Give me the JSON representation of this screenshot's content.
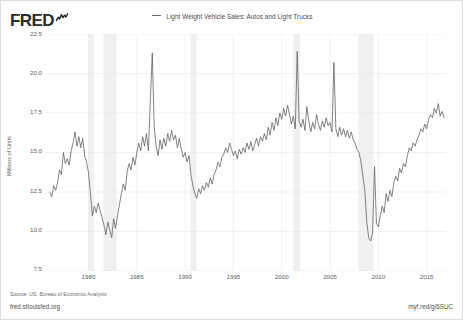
{
  "branding": {
    "logo_text": "FRED",
    "logo_icon": "squiggle-chart-icon"
  },
  "legend": {
    "entries": [
      {
        "label": "Light Weight Vehicle Sales: Autos and Light Trucks",
        "color": "#6e6e6e",
        "marker": "line-dash-icon"
      }
    ]
  },
  "footer": {
    "source": "Source: US. Bureau of Economic Analysis",
    "fred_url": "fred.stlouisfed.org",
    "short_url": "myf.red/g/6SUC"
  },
  "chart_data": {
    "type": "line",
    "title": "",
    "subtitle": "",
    "xlabel": "",
    "ylabel": "Millions of Units",
    "xlim": [
      1975.6,
      2017.0
    ],
    "ylim": [
      7.5,
      22.5
    ],
    "yticks": [
      22.5,
      20.0,
      17.5,
      15.0,
      12.5,
      10.0,
      7.5
    ],
    "ytick_labels": [
      "22.5",
      "20.0",
      "17.5",
      "15.0",
      "12.5",
      "10.0",
      "7.5"
    ],
    "xticks": [
      1980,
      1985,
      1990,
      1995,
      2000,
      2005,
      2010,
      2015
    ],
    "xtick_labels": [
      "1980",
      "1985",
      "1990",
      "1995",
      "2000",
      "2005",
      "2010",
      "2015"
    ],
    "grid": true,
    "grid_color": "#e8e8e8",
    "line_color": "#5a5a5a",
    "legend_position": "top-center",
    "recession_bands": [
      {
        "start": 1980.0,
        "end": 1980.55,
        "label": "1980 recession"
      },
      {
        "start": 1981.55,
        "end": 1982.9,
        "label": "1981-82 recession"
      },
      {
        "start": 1990.55,
        "end": 1991.2,
        "label": "1990-91 recession"
      },
      {
        "start": 2001.2,
        "end": 2001.9,
        "label": "2001 recession"
      },
      {
        "start": 2007.95,
        "end": 2009.5,
        "label": "2007-09 recession"
      }
    ],
    "recession_band_color": "#f0f0f0",
    "series": [
      {
        "name": "Light Weight Vehicle Sales: Autos and Light Trucks",
        "units": "Millions of Units",
        "x": [
          1976.0,
          1976.2,
          1976.4,
          1976.6,
          1976.8,
          1977.0,
          1977.2,
          1977.4,
          1977.6,
          1977.8,
          1978.0,
          1978.2,
          1978.4,
          1978.6,
          1978.8,
          1979.0,
          1979.2,
          1979.4,
          1979.6,
          1979.8,
          1980.0,
          1980.2,
          1980.4,
          1980.6,
          1980.8,
          1981.0,
          1981.2,
          1981.4,
          1981.6,
          1981.8,
          1982.0,
          1982.2,
          1982.4,
          1982.6,
          1982.8,
          1983.0,
          1983.2,
          1983.4,
          1983.6,
          1983.8,
          1984.0,
          1984.2,
          1984.4,
          1984.6,
          1984.8,
          1985.0,
          1985.2,
          1985.4,
          1985.6,
          1985.8,
          1986.0,
          1986.2,
          1986.4,
          1986.6,
          1986.8,
          1987.0,
          1987.2,
          1987.4,
          1987.6,
          1987.8,
          1988.0,
          1988.2,
          1988.4,
          1988.6,
          1988.8,
          1989.0,
          1989.2,
          1989.4,
          1989.6,
          1989.8,
          1990.0,
          1990.2,
          1990.4,
          1990.6,
          1990.8,
          1991.0,
          1991.2,
          1991.4,
          1991.6,
          1991.8,
          1992.0,
          1992.2,
          1992.4,
          1992.6,
          1992.8,
          1993.0,
          1993.2,
          1993.4,
          1993.6,
          1993.8,
          1994.0,
          1994.2,
          1994.4,
          1994.6,
          1994.8,
          1995.0,
          1995.2,
          1995.4,
          1995.6,
          1995.8,
          1996.0,
          1996.2,
          1996.4,
          1996.6,
          1996.8,
          1997.0,
          1997.2,
          1997.4,
          1997.6,
          1997.8,
          1998.0,
          1998.2,
          1998.4,
          1998.6,
          1998.8,
          1999.0,
          1999.2,
          1999.4,
          1999.6,
          1999.8,
          2000.0,
          2000.2,
          2000.4,
          2000.6,
          2000.8,
          2001.0,
          2001.2,
          2001.4,
          2001.6,
          2001.8,
          2002.0,
          2002.2,
          2002.4,
          2002.6,
          2002.8,
          2003.0,
          2003.2,
          2003.4,
          2003.6,
          2003.8,
          2004.0,
          2004.2,
          2004.4,
          2004.6,
          2004.8,
          2005.0,
          2005.2,
          2005.4,
          2005.6,
          2005.8,
          2006.0,
          2006.2,
          2006.4,
          2006.6,
          2006.8,
          2007.0,
          2007.2,
          2007.4,
          2007.6,
          2007.8,
          2008.0,
          2008.2,
          2008.4,
          2008.6,
          2008.8,
          2009.0,
          2009.2,
          2009.4,
          2009.6,
          2009.8,
          2010.0,
          2010.2,
          2010.4,
          2010.6,
          2010.8,
          2011.0,
          2011.2,
          2011.4,
          2011.6,
          2011.8,
          2012.0,
          2012.2,
          2012.4,
          2012.6,
          2012.8,
          2013.0,
          2013.2,
          2013.4,
          2013.6,
          2013.8,
          2014.0,
          2014.2,
          2014.4,
          2014.6,
          2014.8,
          2015.0,
          2015.2,
          2015.4,
          2015.6,
          2015.8,
          2016.0,
          2016.2,
          2016.4,
          2016.6,
          2016.8
        ],
        "y": [
          12.5,
          12.2,
          12.9,
          12.6,
          13.1,
          13.9,
          13.6,
          15.0,
          14.3,
          14.6,
          14.2,
          15.1,
          15.6,
          16.3,
          15.4,
          16.0,
          15.3,
          15.9,
          14.8,
          14.4,
          13.7,
          12.4,
          11.0,
          11.6,
          11.2,
          11.8,
          11.3,
          10.9,
          10.4,
          9.8,
          10.6,
          10.1,
          9.6,
          10.8,
          10.2,
          11.0,
          11.7,
          12.4,
          13.0,
          12.6,
          13.8,
          14.3,
          13.9,
          14.7,
          14.2,
          15.0,
          15.6,
          15.1,
          16.0,
          15.4,
          16.2,
          15.1,
          18.3,
          21.3,
          16.6,
          15.4,
          14.8,
          15.8,
          15.2,
          15.9,
          15.4,
          16.2,
          15.7,
          16.4,
          15.8,
          16.1,
          15.3,
          15.9,
          15.2,
          14.7,
          15.0,
          14.4,
          14.8,
          13.6,
          12.9,
          12.4,
          12.1,
          12.7,
          12.4,
          12.9,
          12.6,
          13.1,
          12.8,
          13.4,
          13.0,
          13.6,
          13.9,
          14.4,
          14.1,
          14.7,
          14.9,
          15.3,
          15.0,
          15.6,
          15.2,
          14.8,
          15.1,
          14.6,
          15.2,
          14.9,
          15.3,
          15.0,
          15.6,
          15.2,
          15.7,
          15.1,
          15.5,
          15.9,
          15.4,
          16.0,
          15.7,
          16.2,
          15.8,
          16.6,
          16.1,
          16.9,
          16.4,
          17.2,
          16.7,
          17.5,
          17.1,
          17.8,
          17.3,
          18.0,
          17.4,
          16.8,
          17.3,
          16.5,
          21.4,
          17.0,
          16.6,
          17.1,
          16.4,
          17.9,
          17.0,
          16.3,
          16.9,
          16.5,
          17.4,
          16.8,
          16.4,
          17.0,
          16.6,
          17.2,
          16.7,
          16.9,
          16.3,
          20.7,
          16.5,
          16.0,
          16.6,
          16.1,
          16.5,
          16.0,
          16.4,
          15.9,
          16.3,
          15.8,
          15.6,
          15.2,
          15.0,
          14.4,
          13.5,
          12.6,
          10.6,
          9.6,
          9.4,
          9.9,
          14.1,
          10.5,
          10.3,
          11.0,
          11.6,
          11.2,
          12.4,
          11.9,
          12.6,
          12.2,
          13.1,
          13.5,
          13.2,
          14.0,
          13.7,
          14.3,
          14.1,
          14.8,
          15.3,
          15.1,
          15.6,
          15.4,
          15.8,
          16.1,
          16.5,
          16.3,
          16.8,
          16.5,
          17.1,
          17.4,
          17.2,
          17.8,
          17.5,
          18.1,
          17.3,
          17.6,
          17.2
        ]
      }
    ],
    "annotations": [
      {
        "text": "spike 1986",
        "x": 1986.6,
        "y": 21.3
      },
      {
        "text": "spike 2001",
        "x": 2001.6,
        "y": 21.4
      },
      {
        "text": "spike 2005",
        "x": 2005.4,
        "y": 20.7
      },
      {
        "text": "trough 2009",
        "x": 2009.2,
        "y": 9.4
      },
      {
        "text": "cash for clunkers 2009",
        "x": 2009.6,
        "y": 14.1
      }
    ]
  }
}
